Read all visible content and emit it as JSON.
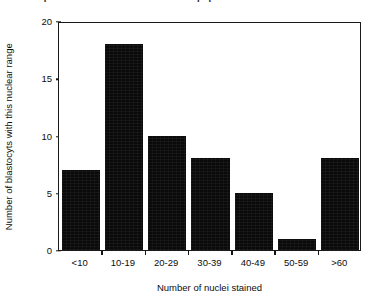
{
  "figure": {
    "title_fragment": "of nuclei present in the mammalian concepeptus",
    "background_color": "#ffffff",
    "bar_color": "#0a0a0a",
    "axis_color": "#1a1a1a"
  },
  "chart_data": {
    "type": "bar",
    "title": "",
    "categories": [
      "<10",
      "10-19",
      "20-29",
      "30-39",
      "40-49",
      "50-59",
      ">60"
    ],
    "values": [
      7,
      18,
      10,
      8,
      5,
      1,
      8
    ],
    "xlabel": "Number of nuclei stained",
    "ylabel": "Number of blastocyts with this nuclear range",
    "ylim": [
      0,
      20
    ],
    "ytick_labels": [
      "0",
      "5",
      "10",
      "15",
      "20"
    ],
    "ytick_values": [
      0,
      5,
      10,
      15,
      20
    ],
    "grid": false,
    "legend": false,
    "legend_position": "none",
    "orientation": "vertical"
  }
}
